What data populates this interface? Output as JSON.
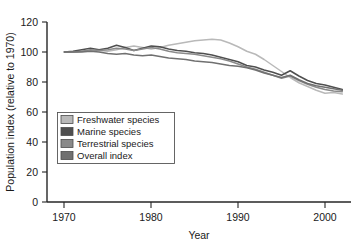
{
  "chart_data": {
    "type": "line",
    "title": "",
    "subtitle": "",
    "xlabel": "Year",
    "ylabel": "Population index (relative to 1970)",
    "xlim": [
      1968,
      2003
    ],
    "ylim": [
      0,
      120
    ],
    "xticks": [
      1970,
      1980,
      1990,
      2000
    ],
    "xtick_labels": [
      "1970",
      "1980",
      "1990",
      "2000"
    ],
    "yticks": [
      0,
      20,
      40,
      60,
      80,
      100,
      120
    ],
    "ytick_labels": [
      "0",
      "20",
      "40",
      "60",
      "80",
      "100",
      "120"
    ],
    "grid": false,
    "legend_position": "inside-lower-left",
    "x": [
      1970,
      1971,
      1972,
      1973,
      1974,
      1975,
      1976,
      1977,
      1978,
      1979,
      1980,
      1981,
      1982,
      1983,
      1984,
      1985,
      1986,
      1987,
      1988,
      1989,
      1990,
      1991,
      1992,
      1993,
      1994,
      1995,
      1996,
      1997,
      1998,
      1999,
      2000,
      2001,
      2002
    ],
    "series": [
      {
        "name": "Freshwater species",
        "color": "#b9b9b9",
        "values": [
          100,
          100,
          100.5,
          101,
          101,
          100.5,
          101.5,
          103,
          104,
          103,
          102,
          103,
          104.5,
          105.5,
          106.5,
          107.5,
          108,
          108.5,
          108,
          106,
          103.5,
          100.5,
          98.5,
          95,
          91,
          87,
          83,
          79.5,
          77,
          74.5,
          72.5,
          73,
          72
        ]
      },
      {
        "name": "Marine species",
        "color": "#4f4f4f",
        "values": [
          100,
          100.5,
          101.5,
          102.5,
          101.5,
          102.5,
          104.5,
          103,
          101,
          102.5,
          104,
          103.5,
          102,
          101,
          100.5,
          99.5,
          99,
          98,
          96.5,
          95,
          93.5,
          91,
          90,
          88,
          86.5,
          84.5,
          87.5,
          84,
          81,
          79,
          78,
          76.5,
          75
        ]
      },
      {
        "name": "Terrestrial species",
        "color": "#8a8a8a",
        "values": [
          100,
          100,
          100.5,
          101.5,
          101,
          101.5,
          102.5,
          102,
          101,
          102,
          103,
          102,
          100.5,
          99.5,
          99,
          98.5,
          97.5,
          96.5,
          95.5,
          94,
          92,
          90,
          88.5,
          86.5,
          84.5,
          82.5,
          84,
          81,
          78.5,
          76.5,
          75,
          74,
          73.5
        ]
      },
      {
        "name": "Overall index",
        "color": "#707070",
        "values": [
          100,
          100,
          100,
          100.5,
          100,
          99,
          98.5,
          99,
          98,
          97.5,
          98,
          97,
          96,
          95.5,
          95,
          94,
          93.5,
          93,
          92,
          91,
          90.5,
          89.5,
          88,
          86,
          84.5,
          83,
          84.5,
          81.5,
          79,
          77.5,
          76.5,
          75.5,
          74.5
        ]
      }
    ]
  },
  "legend": {
    "items": [
      {
        "label": "Freshwater species",
        "color": "#b9b9b9"
      },
      {
        "label": "Marine species",
        "color": "#4f4f4f"
      },
      {
        "label": "Terrestrial species",
        "color": "#8a8a8a"
      },
      {
        "label": "Overall index",
        "color": "#707070"
      }
    ]
  }
}
